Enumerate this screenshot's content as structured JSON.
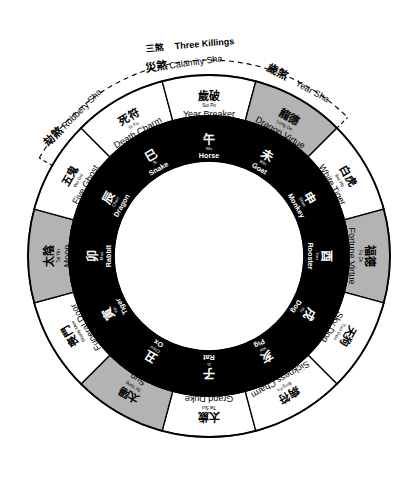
{
  "diagram": {
    "center": {
      "x": 209,
      "y": 256
    },
    "radii": {
      "inner_white": 95,
      "inner_ring_outer": 140,
      "outer_ring_outer": 181,
      "dashed_arc": 196
    },
    "colors": {
      "black": "#000000",
      "white": "#ffffff",
      "gray": "#b3b3b3",
      "stroke": "#000000"
    },
    "annotation": {
      "cn": "三煞",
      "en": "Three Killings",
      "arc_style": "dashed"
    },
    "inner_ring": [
      {
        "cn": "子",
        "pinyin": "Zi",
        "en": "Rat",
        "fill": "black",
        "angle_deg": 90
      },
      {
        "cn": "丑",
        "pinyin": "Chou",
        "en": "Ox",
        "fill": "black",
        "angle_deg": 120
      },
      {
        "cn": "寅",
        "pinyin": "Yin",
        "en": "Tiger",
        "fill": "black",
        "angle_deg": 150
      },
      {
        "cn": "卯",
        "pinyin": "Mao",
        "en": "Rabbit",
        "fill": "black",
        "angle_deg": 180
      },
      {
        "cn": "辰",
        "pinyin": "Chen",
        "en": "Dragon",
        "fill": "black",
        "angle_deg": 210
      },
      {
        "cn": "巳",
        "pinyin": "Si",
        "en": "Snake",
        "fill": "black",
        "angle_deg": 240
      },
      {
        "cn": "午",
        "pinyin": "Wu",
        "en": "Horse",
        "fill": "black",
        "angle_deg": 270
      },
      {
        "cn": "未",
        "pinyin": "Wei",
        "en": "Goat",
        "fill": "black",
        "angle_deg": 300
      },
      {
        "cn": "申",
        "pinyin": "Shen",
        "en": "Monkey",
        "fill": "black",
        "angle_deg": 330
      },
      {
        "cn": "酉",
        "pinyin": "You",
        "en": "Rooster",
        "fill": "black",
        "angle_deg": 0
      },
      {
        "cn": "戌",
        "pinyin": "Xu",
        "en": "Dog",
        "fill": "black",
        "angle_deg": 30
      },
      {
        "cn": "亥",
        "pinyin": "Hai",
        "en": "Pig",
        "fill": "black",
        "angle_deg": 60
      }
    ],
    "outer_ring": [
      {
        "cn": "太歲",
        "pinyin": "Tai Sui",
        "en": "Grand Duke",
        "fill": "white",
        "angle_deg": 90
      },
      {
        "cn": "太陽",
        "pinyin": "Tai Yang",
        "en": "Sun",
        "fill": "gray",
        "angle_deg": 120
      },
      {
        "cn": "喪門",
        "pinyin": "Shang Men",
        "en": "Funeral Door",
        "fill": "white",
        "angle_deg": 150
      },
      {
        "cn": "太陰",
        "pinyin": "Tai Yin",
        "en": "Moon",
        "fill": "gray",
        "angle_deg": 180
      },
      {
        "cn": "五鬼",
        "pinyin": "Wu Gui",
        "en": "Five Ghost",
        "fill": "white",
        "angle_deg": 210
      },
      {
        "cn": "死符",
        "pinyin": "Si Fu",
        "en": "Death Charm",
        "fill": "white",
        "angle_deg": 240
      },
      {
        "cn": "歲破",
        "pinyin": "Sui Po",
        "en": "Year Breaker",
        "fill": "white",
        "angle_deg": 270
      },
      {
        "cn": "龍德",
        "pinyin": "Long De",
        "en": "Dragon Virtue",
        "fill": "gray",
        "angle_deg": 300
      },
      {
        "cn": "白虎",
        "pinyin": "Bai Hu",
        "en": "White Tiger",
        "fill": "white",
        "angle_deg": 330
      },
      {
        "cn": "福德",
        "pinyin": "Fu De",
        "en": "Fortune Virtue",
        "fill": "gray",
        "angle_deg": 0
      },
      {
        "cn": "天狗",
        "pinyin": "Tian Gou",
        "en": "Sky Dog",
        "fill": "white",
        "angle_deg": 30
      },
      {
        "cn": "病符",
        "pinyin": "Bing Fu",
        "en": "Sickness Charm",
        "fill": "white",
        "angle_deg": 60
      }
    ],
    "sha_labels": [
      {
        "cn": "劫煞",
        "en": "Robbery Sha",
        "angle_deg": 225
      },
      {
        "cn": "災煞",
        "en": "Calamity Sha",
        "angle_deg": 262
      },
      {
        "cn": "歲煞",
        "en": "Year Sha",
        "angle_deg": 298
      }
    ]
  }
}
